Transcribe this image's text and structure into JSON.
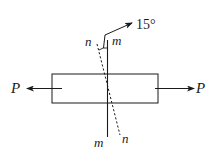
{
  "diagram": {
    "type": "stress-on-inclined-section",
    "labels": {
      "force_left": "P",
      "force_right": "P",
      "section_m_top": "m",
      "section_m_bottom": "m",
      "section_n_top": "n",
      "section_n_bottom": "n",
      "angle": "15°"
    },
    "colors": {
      "stroke": "#1a1a1a",
      "background": "#ffffff"
    }
  }
}
